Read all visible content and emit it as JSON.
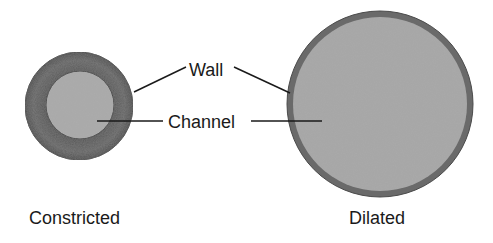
{
  "diagram": {
    "labels": {
      "wall": "Wall",
      "channel": "Channel"
    },
    "captions": {
      "constricted": "Constricted",
      "dilated": "Dilated"
    },
    "colors": {
      "wall_constricted": "#5e5e5e",
      "channel_constricted": "#a9a9a9",
      "wall_dilated": "#6a6a6a",
      "channel_dilated": "#a6a6a6",
      "line": "#1a1a1a",
      "background": "#ffffff"
    }
  }
}
